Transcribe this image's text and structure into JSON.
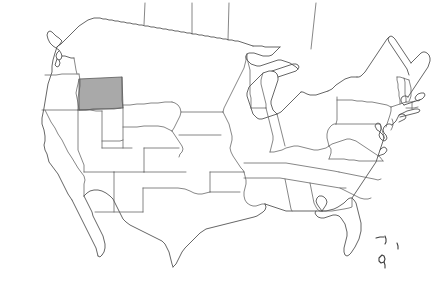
{
  "figure": {
    "kind": "outline-map",
    "region": "United States of America (contiguous 48 states)",
    "title": "",
    "background_color": "#ffffff",
    "outline_color": "#5a5a5a",
    "label_text": ""
  },
  "legend": {
    "highlight_label": "",
    "highlight_color": "#a9a9a9"
  },
  "highlight": {
    "state_name": "Montana",
    "fill_color": "#a9a9a9",
    "stroke_color": "#5a5a5a"
  },
  "states": [
    {
      "name": "Washington",
      "highlighted": false
    },
    {
      "name": "Oregon",
      "highlighted": false
    },
    {
      "name": "California",
      "highlighted": false
    },
    {
      "name": "Idaho",
      "highlighted": false
    },
    {
      "name": "Nevada",
      "highlighted": false
    },
    {
      "name": "Montana",
      "highlighted": true
    },
    {
      "name": "Wyoming",
      "highlighted": false
    },
    {
      "name": "Utah",
      "highlighted": false
    },
    {
      "name": "Arizona",
      "highlighted": false
    },
    {
      "name": "Colorado",
      "highlighted": false
    },
    {
      "name": "New Mexico",
      "highlighted": false
    },
    {
      "name": "North Dakota",
      "highlighted": false
    },
    {
      "name": "South Dakota",
      "highlighted": false
    },
    {
      "name": "Nebraska",
      "highlighted": false
    },
    {
      "name": "Kansas",
      "highlighted": false
    },
    {
      "name": "Oklahoma",
      "highlighted": false
    },
    {
      "name": "Texas",
      "highlighted": false
    },
    {
      "name": "Minnesota",
      "highlighted": false
    },
    {
      "name": "Iowa",
      "highlighted": false
    },
    {
      "name": "Missouri",
      "highlighted": false
    },
    {
      "name": "Arkansas",
      "highlighted": false
    },
    {
      "name": "Louisiana",
      "highlighted": false
    },
    {
      "name": "Wisconsin",
      "highlighted": false
    },
    {
      "name": "Illinois",
      "highlighted": false
    },
    {
      "name": "Michigan",
      "highlighted": false
    },
    {
      "name": "Indiana",
      "highlighted": false
    },
    {
      "name": "Ohio",
      "highlighted": false
    },
    {
      "name": "Kentucky",
      "highlighted": false
    },
    {
      "name": "Tennessee",
      "highlighted": false
    },
    {
      "name": "Mississippi",
      "highlighted": false
    },
    {
      "name": "Alabama",
      "highlighted": false
    },
    {
      "name": "Georgia",
      "highlighted": false
    },
    {
      "name": "Florida",
      "highlighted": false
    },
    {
      "name": "South Carolina",
      "highlighted": false
    },
    {
      "name": "North Carolina",
      "highlighted": false
    },
    {
      "name": "Virginia",
      "highlighted": false
    },
    {
      "name": "West Virginia",
      "highlighted": false
    },
    {
      "name": "Maryland",
      "highlighted": false
    },
    {
      "name": "Delaware",
      "highlighted": false
    },
    {
      "name": "Pennsylvania",
      "highlighted": false
    },
    {
      "name": "New Jersey",
      "highlighted": false
    },
    {
      "name": "New York",
      "highlighted": false
    },
    {
      "name": "Connecticut",
      "highlighted": false
    },
    {
      "name": "Rhode Island",
      "highlighted": false
    },
    {
      "name": "Massachusetts",
      "highlighted": false
    },
    {
      "name": "Vermont",
      "highlighted": false
    },
    {
      "name": "New Hampshire",
      "highlighted": false
    },
    {
      "name": "Maine",
      "highlighted": false
    }
  ]
}
